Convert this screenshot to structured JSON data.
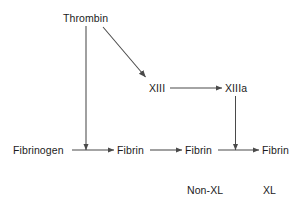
{
  "diagram": {
    "stroke_color": "#4a4a4a",
    "text_color": "#1c1c1c",
    "background_color": "#ffffff",
    "nodes": [
      {
        "id": "thrombin",
        "label": "Thrombin"
      },
      {
        "id": "xiii",
        "label": "XIII"
      },
      {
        "id": "xiiia",
        "label": "XIIIa"
      },
      {
        "id": "fibrinogen",
        "label": "Fibrinogen"
      },
      {
        "id": "fibrin_1",
        "label": "Fibrin"
      },
      {
        "id": "fibrin_2",
        "label": "Fibrin"
      },
      {
        "id": "fibrin_3",
        "label": "Fibrin"
      }
    ],
    "annotations": [
      {
        "id": "non_xl",
        "label": "Non-XL"
      },
      {
        "id": "xl",
        "label": "XL"
      }
    ],
    "edges": [
      {
        "id": "thrombin-to-fibrinogen-fibrin",
        "from": "thrombin",
        "to": "fibrinogen_fibrin_arrow",
        "shape": "vertical"
      },
      {
        "id": "thrombin-to-xiii",
        "from": "thrombin",
        "to": "xiii",
        "shape": "diagonal"
      },
      {
        "id": "xiii-to-xiiia",
        "from": "xiii",
        "to": "xiiia",
        "shape": "horizontal"
      },
      {
        "id": "xiiia-to-fibrin-crosslink",
        "from": "xiiia",
        "to": "fibrin_3_arrow",
        "shape": "vertical"
      },
      {
        "id": "fibrinogen-to-fibrin-1",
        "from": "fibrinogen",
        "to": "fibrin_1",
        "shape": "horizontal"
      },
      {
        "id": "fibrin-1-to-fibrin-2",
        "from": "fibrin_1",
        "to": "fibrin_2",
        "shape": "horizontal"
      },
      {
        "id": "fibrin-2-to-fibrin-3",
        "from": "fibrin_2",
        "to": "fibrin_3",
        "shape": "horizontal"
      }
    ]
  }
}
